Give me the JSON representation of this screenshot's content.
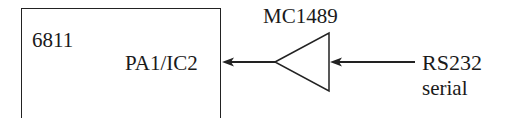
{
  "diagram": {
    "microcontroller": {
      "label": "6811",
      "pin_label": "PA1/IC2"
    },
    "receiver": {
      "label": "MC1489",
      "symbol": "buffer-triangle"
    },
    "input": {
      "label_line1": "RS232",
      "label_line2": "serial"
    },
    "colors": {
      "stroke": "#222222",
      "text": "#1a1a1a",
      "background": "#ffffff"
    }
  }
}
